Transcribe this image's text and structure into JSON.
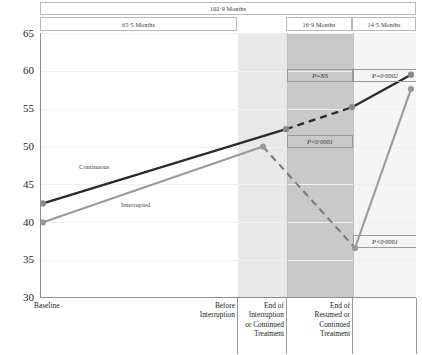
{
  "headers": {
    "total": "102·9 Months",
    "segments": [
      "65·5 Months",
      "16·9 Months",
      "14·5 Months"
    ]
  },
  "chart_data": {
    "type": "line",
    "title": "",
    "xlabel": "",
    "ylabel": "",
    "ylim": [
      30,
      65
    ],
    "yticks": [
      30,
      35,
      40,
      45,
      50,
      55,
      60,
      65
    ],
    "grid": true,
    "legend_position": "inline",
    "x": [
      "Baseline",
      "Before Interruption",
      "End of Interruption or Continued Treatment",
      "End of Resumed or Continued Treatment"
    ],
    "xtick_labels": [
      "Baseline",
      "Before\nInterruption",
      "End of\nInterruption\nor Continued\nTreatment",
      "End of\nResumed or\nContinued\nTreatment"
    ],
    "series": [
      {
        "name": "Continuous",
        "color": "#2b2b2b",
        "style": "solid",
        "values": [
          42.5,
          52.3,
          55.2,
          59.5
        ]
      },
      {
        "name": "Interrupted",
        "color": "#9a9a9a",
        "style": "solid-with-dashed-projection",
        "values": [
          40.0,
          50.0,
          36.6,
          57.5
        ]
      }
    ],
    "projection": {
      "name": "Interrupted projected",
      "color": "#6f6f6f",
      "style": "dashed",
      "values": [
        50.0,
        36.6
      ]
    },
    "annotations": [
      {
        "id": "p-top-middle",
        "text": "P=NS",
        "segment": "End of Interruption or Continued Treatment"
      },
      {
        "id": "p-top-right",
        "text": "P=0·0002",
        "segment": "End of Resumed or Continued Treatment"
      },
      {
        "id": "p-mid-middle",
        "text": "P<0·0001",
        "segment": "End of Interruption or Continued Treatment"
      },
      {
        "id": "p-low-right",
        "text": "P<0·0001",
        "segment": "End of Resumed or Continued Treatment"
      }
    ],
    "bands": [
      {
        "id": "band-before-interruption",
        "shade": "light",
        "color": "#e8e8e8"
      },
      {
        "id": "band-interruption",
        "shade": "dark",
        "color": "#c9c9c9"
      }
    ]
  },
  "xlabels": {
    "baseline": "Baseline",
    "before_interruption": "Before\nInterruption",
    "end_interruption": "End of\nInterruption\nor Continued\nTreatment",
    "end_resumed": "End of\nResumed or\nContinued\nTreatment"
  },
  "curve_labels": {
    "continuous": "Continuous",
    "interrupted": "Interrupted"
  }
}
